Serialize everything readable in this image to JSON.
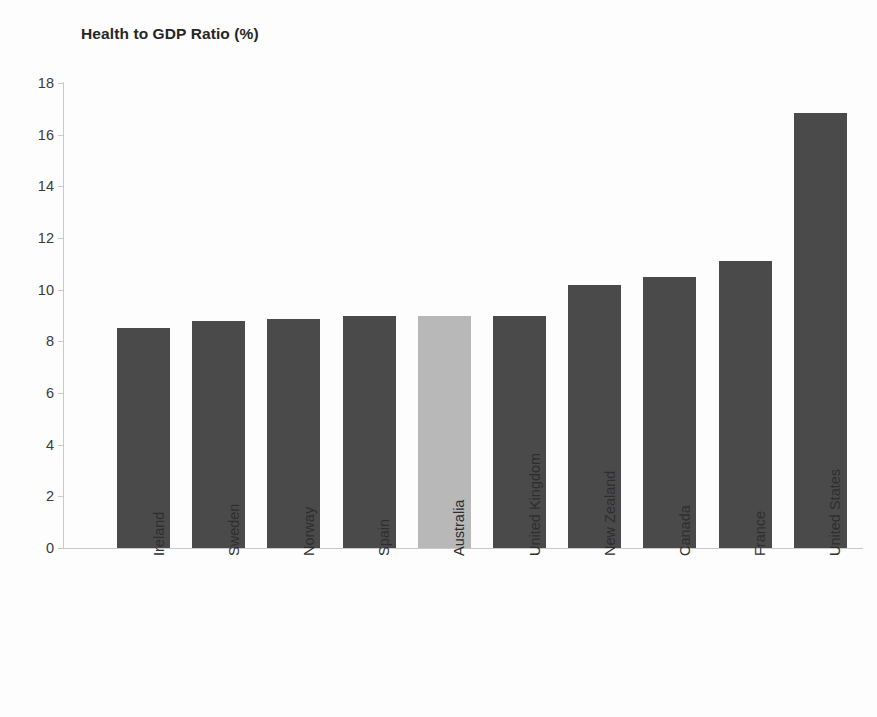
{
  "chart_data": {
    "type": "bar",
    "title": "Health to GDP Ratio (%)",
    "xlabel": "",
    "ylabel": "",
    "ylim": [
      0,
      18
    ],
    "ytick_step": 2,
    "yticks": [
      "0",
      "2",
      "4",
      "6",
      "8",
      "10",
      "12",
      "14",
      "16",
      "18"
    ],
    "grid": false,
    "legend": "none",
    "categories": [
      "Ireland",
      "Sweden",
      "Norway",
      "Spain",
      "Australia",
      "United Kingdom",
      "New Zealand",
      "Canada",
      "France",
      "United States"
    ],
    "values": [
      8.5,
      8.8,
      8.85,
      9.0,
      9.0,
      9.0,
      10.2,
      10.5,
      11.1,
      16.85
    ],
    "bar_colors": [
      "#4a4a4a",
      "#4a4a4a",
      "#4a4a4a",
      "#4a4a4a",
      "#b8b8b8",
      "#4a4a4a",
      "#4a4a4a",
      "#4a4a4a",
      "#4a4a4a",
      "#4a4a4a"
    ],
    "highlight_category": "Australia",
    "highlight_color": "#b8b8b8",
    "default_color": "#4a4a4a",
    "axis_color": "#c9c9c9",
    "text_color": "#2e2e2e",
    "background": "#fdfdfd"
  }
}
